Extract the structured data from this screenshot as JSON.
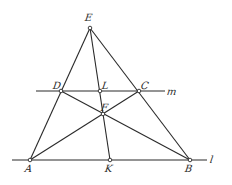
{
  "diagram": {
    "type": "geometric-construction",
    "stroke_color": "#2a2a2a",
    "background": "#ffffff",
    "points": [
      {
        "id": "E",
        "label": "E",
        "x": 90,
        "y": 28,
        "lx": 85,
        "ly": 13
      },
      {
        "id": "D",
        "label": "D",
        "x": 61,
        "y": 91,
        "lx": 53,
        "ly": 81
      },
      {
        "id": "L",
        "label": "L",
        "x": 100,
        "y": 91,
        "lx": 102,
        "ly": 81
      },
      {
        "id": "C",
        "label": "C",
        "x": 139,
        "y": 91,
        "lx": 141,
        "ly": 81
      },
      {
        "id": "F",
        "label": "F",
        "x": 103,
        "y": 114,
        "lx": 101,
        "ly": 103
      },
      {
        "id": "A",
        "label": "A",
        "x": 30,
        "y": 160,
        "lx": 25,
        "ly": 164
      },
      {
        "id": "K",
        "label": "K",
        "x": 110,
        "y": 160,
        "lx": 105,
        "ly": 164
      },
      {
        "id": "B",
        "label": "B",
        "x": 190,
        "y": 160,
        "lx": 185,
        "ly": 164
      }
    ],
    "lines": [
      {
        "id": "m",
        "label": "m",
        "x1": 36,
        "y1": 91,
        "x2": 165,
        "y2": 91,
        "lx": 167,
        "ly": 87
      },
      {
        "id": "l",
        "label": "l",
        "x1": 12,
        "y1": 160,
        "x2": 207,
        "y2": 160,
        "lx": 210,
        "ly": 155
      }
    ],
    "segments": [
      [
        "E",
        "A"
      ],
      [
        "E",
        "B"
      ],
      [
        "E",
        "K"
      ],
      [
        "A",
        "C"
      ],
      [
        "D",
        "B"
      ]
    ]
  }
}
